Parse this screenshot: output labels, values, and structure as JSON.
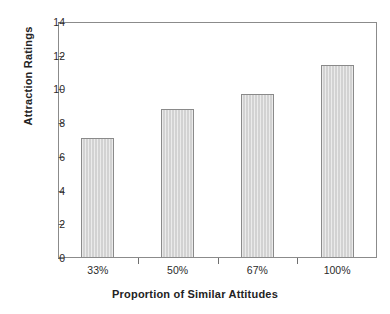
{
  "chart_data": {
    "type": "bar",
    "title": "",
    "xlabel": "Proportion of Similar Attitudes",
    "ylabel": "Attraction Ratings",
    "categories": [
      "33%",
      "50%",
      "67%",
      "100%"
    ],
    "values": [
      7.1,
      8.85,
      9.7,
      11.45
    ],
    "ylim": [
      0,
      14
    ],
    "yticks": [
      0,
      2,
      4,
      6,
      8,
      10,
      12,
      14
    ],
    "ytick_labels": [
      "0",
      "2",
      "4",
      "6",
      "8",
      "10",
      "12",
      "14"
    ],
    "grid": false,
    "legend": false,
    "bar_color": "#d2d2d2",
    "bar_edge_color": "#8a8a8a",
    "axis_color": "#8b8b8b"
  }
}
